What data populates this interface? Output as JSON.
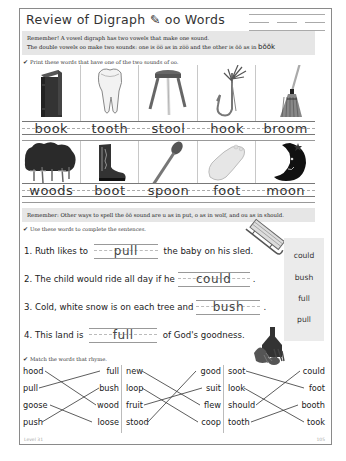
{
  "header": {
    "title": "Review of Digraph ✎ oo Words"
  },
  "remember1": {
    "line1": "Remember! A vowel digraph has two vowels that make one sound.",
    "line2_pre": "The double vowels oo make two sounds: one is o̅o̅ as in zo̅o̅ and the other is ŏŏ as in ",
    "line2_word": "bŏŏk"
  },
  "picture_section": {
    "instruction": "Print these words that have one of the two sounds of oo.",
    "check_icon": "✔",
    "row1": [
      "book",
      "tooth",
      "stool",
      "hook",
      "broom"
    ],
    "row2": [
      "woods",
      "boot",
      "spoon",
      "foot",
      "moon"
    ]
  },
  "remember2": {
    "text": "Remember: Other ways to spell the ŏŏ sound are u as in put, o as in wolf, and ou as in should."
  },
  "sentence_section": {
    "instruction": "Use these words to complete the sentences.",
    "sentences": [
      {
        "pre": "1. Ruth likes to",
        "answer": "pull",
        "post": "the baby on his sled."
      },
      {
        "pre": "2. The child would ride all day if he",
        "answer": "could",
        "post": "."
      },
      {
        "pre": "3. Cold, white snow is on each tree and",
        "answer": "bush",
        "post": "."
      },
      {
        "pre": "4. This land is",
        "answer": "full",
        "post": "of God's goodness."
      }
    ],
    "word_bank": [
      "could",
      "bush",
      "full",
      "pull"
    ]
  },
  "match_section": {
    "instruction": "Match the words that rhyme.",
    "columns": [
      {
        "left": [
          "hood",
          "pull",
          "goose",
          "push"
        ],
        "right": [
          "full",
          "bush",
          "wood",
          "loose"
        ]
      },
      {
        "left": [
          "new",
          "loop",
          "fruit",
          "stood"
        ],
        "right": [
          "good",
          "suit",
          "flew",
          "coop"
        ]
      },
      {
        "left": [
          "soot",
          "look",
          "should",
          "tooth"
        ],
        "right": [
          "could",
          "foot",
          "booth",
          "took"
        ]
      }
    ]
  },
  "footer": {
    "level": "Level 31",
    "page": "105"
  }
}
